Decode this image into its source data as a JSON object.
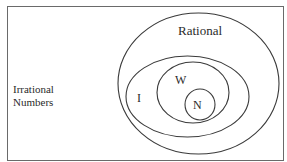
{
  "diagram": {
    "colors": {
      "stroke": "#3a3a3a",
      "border": "#6a6a6a",
      "background": "#ffffff",
      "text": "#2a2a2a"
    },
    "universe": {
      "label_line1": "Irrational",
      "label_line2": "Numbers"
    },
    "sets": [
      {
        "id": "rational",
        "label": "Rational"
      },
      {
        "id": "integers",
        "label": "I"
      },
      {
        "id": "whole",
        "label": "W"
      },
      {
        "id": "natural",
        "label": "N"
      }
    ]
  }
}
